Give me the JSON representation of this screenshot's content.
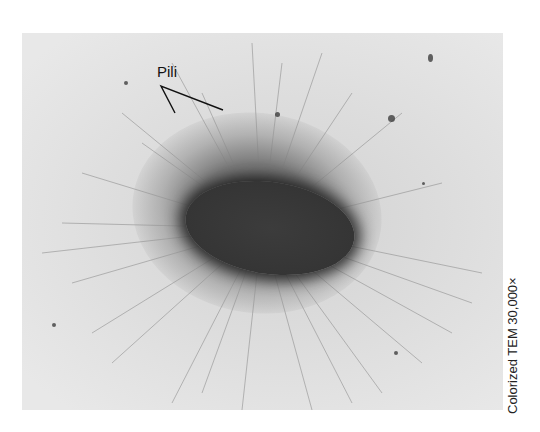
{
  "figure": {
    "label": "Pili",
    "caption": "Colorized TEM 30,000×",
    "colors": {
      "background": "#ffffff",
      "micrograph_field": "#e0e0e0",
      "cell_body": "#353535",
      "label_text": "#111111"
    }
  }
}
